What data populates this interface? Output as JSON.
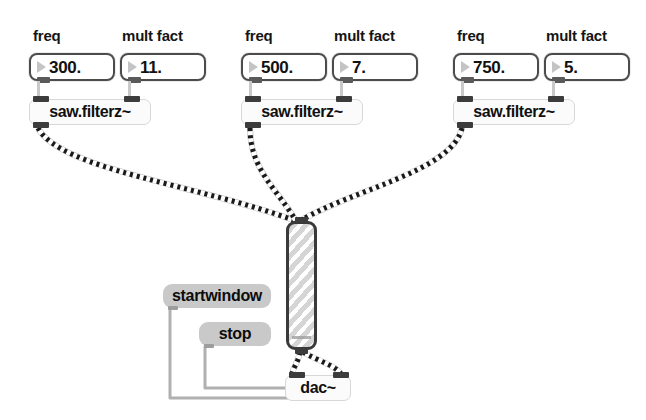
{
  "patcher": {
    "title": "saw.filterz~ additive patch",
    "background": "#ffffff"
  },
  "comments": [
    {
      "id": "freq-1",
      "text": "freq",
      "x": 33,
      "y": 27
    },
    {
      "id": "mult-1",
      "text": "mult fact",
      "x": 122,
      "y": 27
    },
    {
      "id": "freq-2",
      "text": "freq",
      "x": 245,
      "y": 27
    },
    {
      "id": "mult-2",
      "text": "mult fact",
      "x": 334,
      "y": 27
    },
    {
      "id": "freq-3",
      "text": "freq",
      "x": 457,
      "y": 27
    },
    {
      "id": "mult-3",
      "text": "mult fact",
      "x": 546,
      "y": 27
    }
  ],
  "number_boxes": [
    {
      "id": "freq-num-1",
      "value": "300.",
      "label": "freq",
      "x": 29,
      "y": 53,
      "w": 86,
      "h": 28
    },
    {
      "id": "mult-num-1",
      "value": "11.",
      "label": "mult fact",
      "x": 120,
      "y": 53,
      "w": 86,
      "h": 28
    },
    {
      "id": "freq-num-2",
      "value": "500.",
      "label": "freq",
      "x": 241,
      "y": 53,
      "w": 86,
      "h": 28
    },
    {
      "id": "mult-num-2",
      "value": "7.",
      "label": "mult fact",
      "x": 332,
      "y": 53,
      "w": 86,
      "h": 28
    },
    {
      "id": "freq-num-3",
      "value": "750.",
      "label": "freq",
      "x": 453,
      "y": 53,
      "w": 86,
      "h": 28
    },
    {
      "id": "mult-num-3",
      "value": "5.",
      "label": "mult fact",
      "x": 544,
      "y": 53,
      "w": 86,
      "h": 28
    }
  ],
  "object_boxes": [
    {
      "id": "saw-1",
      "text": "saw.filterz~",
      "x": 29,
      "y": 99,
      "w": 122,
      "h": 26
    },
    {
      "id": "saw-2",
      "text": "saw.filterz~",
      "x": 241,
      "y": 99,
      "w": 122,
      "h": 26
    },
    {
      "id": "saw-3",
      "text": "saw.filterz~",
      "x": 453,
      "y": 99,
      "w": 122,
      "h": 26
    },
    {
      "id": "dac",
      "text": "dac~",
      "x": 285,
      "y": 375,
      "w": 66,
      "h": 26
    }
  ],
  "message_boxes": [
    {
      "id": "startwindow",
      "text": "startwindow",
      "x": 163,
      "y": 284,
      "w": 108,
      "h": 24
    },
    {
      "id": "stop",
      "text": "stop",
      "x": 199,
      "y": 322,
      "w": 72,
      "h": 24
    }
  ],
  "gain_slider": {
    "id": "gain-slider",
    "name": "gain~",
    "x": 286,
    "y": 221,
    "w": 31,
    "h": 129,
    "knob_y": 112,
    "border_color": "#3a3a3a",
    "stripe_color": "#d5d5d5"
  },
  "cables": {
    "signal_color": "#1a1a1a",
    "control_color": "#b0b0b0",
    "signal_style": "dashed",
    "paths": [
      {
        "id": "saw1-to-gain",
        "type": "signal",
        "d": "M 38 128 C 60 170 200 185 296 221"
      },
      {
        "id": "saw2-to-gain",
        "type": "signal",
        "d": "M 250 128 C 250 170 278 190 296 221"
      },
      {
        "id": "saw3-to-gain",
        "type": "signal",
        "d": "M 462 128 C 452 172 350 190 300 221"
      },
      {
        "id": "gain-to-dac-left",
        "type": "signal",
        "d": "M 300 352 C 298 364 292 368 292 376"
      },
      {
        "id": "gain-to-dac-right",
        "type": "signal",
        "d": "M 303 352 C 320 362 338 366 342 376"
      },
      {
        "id": "startwindow-to-dac",
        "type": "control",
        "d": "M 170 309 L 170 398 L 290 398 L 290 382"
      },
      {
        "id": "stop-to-dac",
        "type": "control",
        "d": "M 205 347 L 205 388 L 288 388 L 288 382"
      }
    ]
  }
}
